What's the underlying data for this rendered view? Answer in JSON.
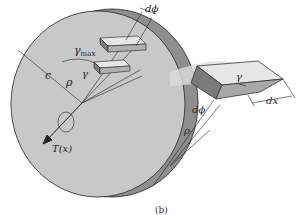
{
  "figure": {
    "caption": "(b)",
    "labels": {
      "d_phi_top": "dϕ",
      "gamma_max": "γ",
      "gamma_max_sub": "max",
      "c": "c",
      "rho": "ρ",
      "gamma": "γ",
      "torque": "T(x)",
      "gamma_element": "γ",
      "dx": "dx",
      "d_phi_bottom": "dϕ",
      "rho_bottom": "ρ"
    },
    "colors": {
      "disk_face": "#c8c8c8",
      "disk_rim": "#8f8f8f",
      "element_light": "#e6e6e6",
      "element_dark": "#7a7a7a",
      "band": "#dcdcdc",
      "line": "#222222"
    }
  }
}
